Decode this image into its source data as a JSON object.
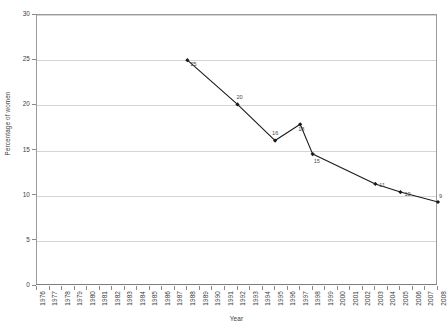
{
  "chart_data": {
    "type": "line",
    "title": "",
    "xlabel": "Year",
    "ylabel": "Percentage of women",
    "xlim": [
      1976,
      2008
    ],
    "ylim": [
      0,
      30
    ],
    "ytick_step": 5,
    "yticks": [
      0,
      5,
      10,
      15,
      20,
      25,
      30
    ],
    "xticks": [
      1976,
      1977,
      1978,
      1979,
      1980,
      1981,
      1982,
      1983,
      1984,
      1985,
      1986,
      1987,
      1988,
      1989,
      1990,
      1991,
      1992,
      1993,
      1994,
      1995,
      1996,
      1997,
      1998,
      1999,
      2000,
      2001,
      2002,
      2003,
      2004,
      2005,
      2006,
      2007,
      2008
    ],
    "grid": "horizontal",
    "legend": "none",
    "series": [
      {
        "name": "Percentage of women",
        "color": "#1a1a1a",
        "marker": "diamond",
        "x": [
          1988,
          1992,
          1995,
          1997,
          1998,
          2003,
          2005,
          2008
        ],
        "y": [
          25.0,
          20.1,
          16.1,
          17.9,
          14.6,
          11.3,
          10.4,
          9.3
        ],
        "data_labels": [
          "25",
          "20",
          "16",
          "18",
          "15",
          "11",
          "10",
          "9"
        ]
      }
    ]
  },
  "axes": {
    "y_title": "Percentage of women",
    "x_title": "Year",
    "y_tick_labels": [
      "30",
      "25",
      "20",
      "15",
      "10",
      "5",
      "0"
    ],
    "x_tick_labels": [
      "1976",
      "1977",
      "1978",
      "1979",
      "1980",
      "1981",
      "1982",
      "1983",
      "1984",
      "1985",
      "1986",
      "1987",
      "1988",
      "1989",
      "1990",
      "1991",
      "1992",
      "1993",
      "1994",
      "1995",
      "1996",
      "1997",
      "1998",
      "1999",
      "2000",
      "2001",
      "2002",
      "2003",
      "2004",
      "2005",
      "2006",
      "2007",
      "2008"
    ]
  },
  "colors": {
    "line": "#1a1a1a",
    "grid": "#d4d4d4",
    "axis": "#8a8a8a",
    "text": "#3d3d3d",
    "background": "#ffffff"
  },
  "caption": {
    "text": ""
  }
}
